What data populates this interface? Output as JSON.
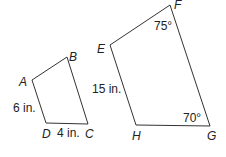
{
  "figure_left": {
    "vertices": [
      {
        "name": "A",
        "x": 32,
        "y": 80
      },
      {
        "name": "B",
        "x": 67,
        "y": 57
      },
      {
        "name": "C",
        "x": 88,
        "y": 124
      },
      {
        "name": "D",
        "x": 46,
        "y": 123
      }
    ],
    "labels": {
      "A": "A",
      "B": "B",
      "C": "C",
      "D": "D",
      "side_ad": "6 in.",
      "side_dc": "4 in."
    }
  },
  "figure_right": {
    "vertices": [
      {
        "name": "E",
        "x": 110,
        "y": 45
      },
      {
        "name": "F",
        "x": 170,
        "y": 5
      },
      {
        "name": "G",
        "x": 210,
        "y": 126
      },
      {
        "name": "H",
        "x": 136,
        "y": 125
      }
    ],
    "labels": {
      "E": "E",
      "F": "F",
      "G": "G",
      "H": "H",
      "side_eh": "15 in.",
      "angle_f": "75°",
      "angle_g": "70°"
    }
  },
  "colors": {
    "stroke": "#333333",
    "text": "#222222",
    "background": "#ffffff"
  }
}
